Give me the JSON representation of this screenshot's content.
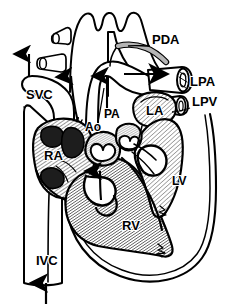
{
  "figure": {
    "background_color": "#ffffff",
    "line_color": "#000000",
    "shade_color": "#9a9a9a",
    "width": 226,
    "height": 307
  },
  "labels": {
    "pda": "PDA",
    "lpa": "LPA",
    "lpv": "LPV",
    "svc": "SVC",
    "ivc": "IVC",
    "ao": "Ao",
    "pa": "PA",
    "la": "LA",
    "lv": "LV",
    "ra": "RA",
    "rv": "RV"
  },
  "label_positions": [
    {
      "key": "pda",
      "text": "PDA",
      "x": 152,
      "y": 44,
      "size": 13
    },
    {
      "key": "lpa",
      "text": "LPA",
      "x": 188,
      "y": 84,
      "size": 13
    },
    {
      "key": "lpv",
      "text": "LPV",
      "x": 192,
      "y": 105,
      "size": 13
    },
    {
      "key": "svc",
      "text": "SVC",
      "x": 31,
      "y": 97,
      "size": 13
    },
    {
      "key": "ivc",
      "text": "IVC",
      "x": 44,
      "y": 263,
      "size": 13
    },
    {
      "key": "ao",
      "text": "Ao",
      "x": 92,
      "y": 128,
      "size": 12
    },
    {
      "key": "pa",
      "text": "PA",
      "x": 111,
      "y": 116,
      "size": 12
    },
    {
      "key": "la",
      "text": "LA",
      "x": 153,
      "y": 110,
      "size": 13
    },
    {
      "key": "lv",
      "text": "LV",
      "x": 177,
      "y": 180,
      "size": 12
    },
    {
      "key": "ra",
      "text": "RA",
      "x": 51,
      "y": 156,
      "size": 13
    },
    {
      "key": "rv",
      "text": "RV",
      "x": 129,
      "y": 226,
      "size": 13
    }
  ],
  "flow_arrows": [
    {
      "name": "svc-inflow-arrow",
      "direction": "down",
      "x": 29,
      "y_from": 55,
      "y_to": 78
    },
    {
      "name": "ivc-inflow-arrow",
      "direction": "up",
      "x": 46,
      "y_from": 303,
      "y_to": 283
    },
    {
      "name": "aorta-outflow-arrow",
      "direction": "up",
      "x": 70,
      "y_from": 110,
      "y_to": 72
    },
    {
      "name": "pa-outflow-arrow",
      "direction": "up",
      "x": 107,
      "y_from": 110,
      "y_to": 72
    },
    {
      "name": "pda-shunt-arrow",
      "direction": "right",
      "x_from": 125,
      "x_to": 172,
      "y": 73
    },
    {
      "name": "rv-inflow-arrow",
      "direction": "up",
      "x": 102,
      "y_from": 200,
      "y_to": 172
    }
  ],
  "structures": [
    {
      "name": "aortic-arch",
      "label": "Ao"
    },
    {
      "name": "pulmonary-artery",
      "label": "PA"
    },
    {
      "name": "patent-ductus-arteriosus",
      "label": "PDA"
    },
    {
      "name": "left-pulmonary-artery",
      "label": "LPA"
    },
    {
      "name": "left-pulmonary-vein",
      "label": "LPV"
    },
    {
      "name": "superior-vena-cava",
      "label": "SVC"
    },
    {
      "name": "inferior-vena-cava",
      "label": "IVC"
    },
    {
      "name": "left-atrium",
      "label": "LA"
    },
    {
      "name": "right-atrium",
      "label": "RA"
    },
    {
      "name": "left-ventricle",
      "label": "LV"
    },
    {
      "name": "right-ventricle",
      "label": "RV"
    }
  ]
}
